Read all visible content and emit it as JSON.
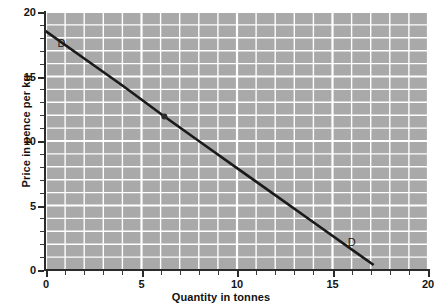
{
  "chart_data": {
    "type": "line",
    "title": "",
    "subtitle": "",
    "xlabel": "Quantity in tonnes",
    "ylabel": "Price in pence per kg",
    "xlim": [
      0,
      20
    ],
    "ylim": [
      0,
      20
    ],
    "xticks": [
      0,
      5,
      10,
      15,
      20
    ],
    "yticks": [
      0,
      5,
      10,
      15,
      20
    ],
    "xtick_labels": [
      "0",
      "5",
      "10",
      "15",
      "20"
    ],
    "ytick_labels": [
      "0",
      "5",
      "10",
      "15",
      "20"
    ],
    "x_minor_step": 1,
    "y_minor_step": 1,
    "grid": true,
    "grid_color": "#ffffff",
    "plot_background": "#a9a9a9",
    "figure_background": "#ffffff",
    "legend": "none",
    "series": [
      {
        "name": "D",
        "type": "line",
        "color": "#1a1a1a",
        "linewidth": 2.6,
        "x": [
          0.0,
          17.1
        ],
        "y": [
          18.5,
          0.45
        ],
        "slope": -1.06,
        "intercept": 18.5,
        "points": [
          {
            "x": 0.0,
            "y": 18.5
          },
          {
            "x": 2.0,
            "y": 16.4
          },
          {
            "x": 4.0,
            "y": 14.3
          },
          {
            "x": 6.2,
            "y": 11.9
          },
          {
            "x": 8.0,
            "y": 10.0
          },
          {
            "x": 10.0,
            "y": 7.9
          },
          {
            "x": 12.0,
            "y": 5.8
          },
          {
            "x": 14.0,
            "y": 3.7
          },
          {
            "x": 16.0,
            "y": 1.6
          },
          {
            "x": 17.1,
            "y": 0.45
          }
        ]
      }
    ],
    "markers": [
      {
        "name": "equilibrium-point",
        "x": 6.2,
        "y": 11.9,
        "color": "#2b2b2b",
        "size": 3
      }
    ],
    "annotations": [
      {
        "name": "curve-label-top",
        "text": "D",
        "x": 0.6,
        "y": 17.6
      },
      {
        "name": "curve-label-bottom",
        "text": "D",
        "x": 15.8,
        "y": 2.2
      }
    ]
  },
  "axes": {
    "x_title": "Quantity in tonnes",
    "y_title": "Price in pence per kg",
    "x_tick_labels": [
      "0",
      "5",
      "10",
      "15",
      "20"
    ],
    "y_tick_labels": [
      "0",
      "5",
      "10",
      "15",
      "20"
    ]
  },
  "labels": {
    "demand_top": "D",
    "demand_bottom": "D"
  }
}
